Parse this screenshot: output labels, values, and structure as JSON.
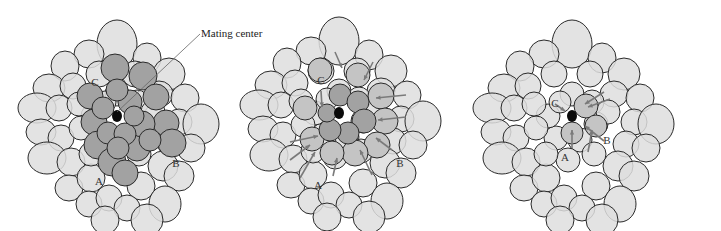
{
  "figure": {
    "callout": {
      "label": "Mating center",
      "line": [
        200,
        34,
        117,
        112
      ]
    },
    "colors": {
      "light_cell": "#dedede",
      "dark_cell": "#a2a2a2",
      "mid_cell": "#c4c4c4",
      "outline": "#2a2a2a",
      "arrow": "#7a7a7a",
      "center_dot": "#0a0a0a",
      "label": "#333333"
    },
    "panels": [
      {
        "id": "panel-1",
        "offset": [
          0,
          0
        ],
        "center": [
          117,
          116
        ],
        "labels": [
          {
            "text": "C",
            "x": 95,
            "y": 86
          },
          {
            "text": "B",
            "x": 176,
            "y": 167
          },
          {
            "text": "A",
            "x": 99,
            "y": 185
          }
        ],
        "dark_cells": [
          [
            115,
            68,
            14
          ],
          [
            143,
            76,
            14
          ],
          [
            156,
            97,
            13
          ],
          [
            166,
            123,
            13
          ],
          [
            172,
            143,
            14
          ],
          [
            90,
            96,
            13
          ],
          [
            94,
            122,
            13
          ],
          [
            98,
            145,
            14
          ],
          [
            112,
            162,
            14
          ],
          [
            125,
            173,
            13
          ],
          [
            137,
            148,
            13
          ],
          [
            142,
            124,
            13
          ],
          [
            130,
            102,
            12
          ],
          [
            117,
            90,
            11
          ],
          [
            103,
            108,
            11
          ],
          [
            108,
            133,
            11
          ],
          [
            125,
            134,
            11
          ],
          [
            134,
            116,
            10
          ],
          [
            118,
            148,
            11
          ],
          [
            150,
            140,
            11
          ]
        ],
        "arrows": []
      },
      {
        "id": "panel-2",
        "offset": [
          240,
          0
        ],
        "center": [
          339,
          113
        ],
        "labels": [
          {
            "text": "C",
            "x": 321,
            "y": 84
          },
          {
            "text": "B",
            "x": 400,
            "y": 167
          },
          {
            "text": "A",
            "x": 318,
            "y": 189
          }
        ],
        "dark_cells": [
          [
            340,
            95,
            11
          ],
          [
            358,
            102,
            11
          ],
          [
            364,
            121,
            12
          ],
          [
            348,
            133,
            11
          ],
          [
            330,
            130,
            11
          ],
          [
            327,
            113,
            9
          ]
        ],
        "mid_cells": [
          [
            320,
            70,
            12
          ],
          [
            358,
            75,
            12
          ],
          [
            381,
            96,
            13
          ],
          [
            385,
            121,
            13
          ],
          [
            377,
            145,
            13
          ],
          [
            355,
            153,
            13
          ],
          [
            332,
            153,
            12
          ],
          [
            312,
            139,
            12
          ],
          [
            305,
            108,
            12
          ]
        ],
        "arrows": [
          [
            335,
            52,
            342,
            68
          ],
          [
            373,
            62,
            364,
            80
          ],
          [
            406,
            95,
            376,
            98
          ],
          [
            406,
            117,
            378,
            120
          ],
          [
            392,
            150,
            376,
            138
          ],
          [
            372,
            175,
            360,
            150
          ],
          [
            333,
            176,
            337,
            158
          ],
          [
            300,
            178,
            315,
            152
          ],
          [
            290,
            142,
            318,
            136
          ],
          [
            321,
            91,
            322,
            107
          ],
          [
            290,
            160,
            310,
            145
          ]
        ]
      },
      {
        "id": "panel-3",
        "offset": [
          480,
          0
        ],
        "center": [
          572,
          116
        ],
        "labels": [
          {
            "text": "C",
            "x": 555,
            "y": 107
          },
          {
            "text": "B",
            "x": 607,
            "y": 144
          },
          {
            "text": "A",
            "x": 565,
            "y": 161
          }
        ],
        "mid_cells": [
          [
            586,
            106,
            12
          ],
          [
            596,
            126,
            11
          ],
          [
            572,
            133,
            11
          ]
        ],
        "arrows": [
          [
            610,
            99,
            588,
            107
          ],
          [
            604,
            92,
            585,
            104
          ],
          [
            572,
            148,
            572,
            130
          ],
          [
            588,
            152,
            592,
            130
          ],
          [
            555,
            104,
            565,
            111
          ],
          [
            604,
            141,
            585,
            126
          ]
        ]
      }
    ]
  }
}
